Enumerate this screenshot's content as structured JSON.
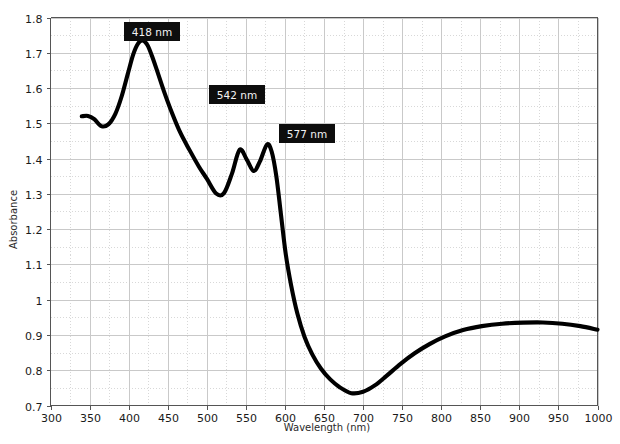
{
  "chart_data": {
    "type": "line",
    "title": "",
    "xlabel": "Wavelength (nm)",
    "ylabel": "Absorbance",
    "xlim": [
      300,
      1000
    ],
    "ylim": [
      0.7,
      1.8
    ],
    "grid": true,
    "legend": "none",
    "x_major_step": 50,
    "x_minor_step": 25,
    "y_major_step": 0.1,
    "y_minor_step": 0.05,
    "x_ticks": [
      "300",
      "350",
      "400",
      "450",
      "500",
      "550",
      "600",
      "650",
      "700",
      "750",
      "800",
      "850",
      "900",
      "950",
      "1000"
    ],
    "y_ticks": [
      "0.7",
      "0.8",
      "0.9",
      "1",
      "1.1",
      "1.2",
      "1.3",
      "1.4",
      "1.5",
      "1.6",
      "1.7",
      "1.8"
    ],
    "series": [
      {
        "name": "absorbance",
        "color": "#000000",
        "x": [
          340,
          348,
          356,
          365,
          374,
          383,
          391,
          399,
          406,
          412,
          418,
          424,
          430,
          437,
          445,
          455,
          466,
          478,
          490,
          500,
          512,
          522,
          532,
          542,
          551,
          560,
          568,
          577,
          583,
          589,
          595,
          601,
          608,
          616,
          625,
          635,
          646,
          658,
          670,
          685,
          700,
          715,
          730,
          748,
          766,
          785,
          805,
          828,
          852,
          878,
          905,
          930,
          955,
          978,
          1000
        ],
        "y": [
          1.52,
          1.521,
          1.512,
          1.492,
          1.497,
          1.527,
          1.576,
          1.641,
          1.696,
          1.726,
          1.735,
          1.722,
          1.69,
          1.645,
          1.592,
          1.532,
          1.474,
          1.424,
          1.377,
          1.343,
          1.301,
          1.302,
          1.356,
          1.425,
          1.398,
          1.365,
          1.392,
          1.44,
          1.42,
          1.35,
          1.24,
          1.13,
          1.04,
          0.96,
          0.895,
          0.845,
          0.805,
          0.774,
          0.752,
          0.735,
          0.739,
          0.757,
          0.784,
          0.818,
          0.848,
          0.874,
          0.896,
          0.914,
          0.925,
          0.932,
          0.935,
          0.9355,
          0.932,
          0.925,
          0.915
        ]
      }
    ],
    "annotations": [
      {
        "label": "418 nm",
        "x": 418,
        "y": 1.795,
        "box_left": 124,
        "box_top": 22,
        "box_width": 56,
        "box_height": 19
      },
      {
        "label": "542 nm",
        "x": 542,
        "y": 1.59,
        "box_left": 209,
        "box_top": 85,
        "box_width": 56,
        "box_height": 19
      },
      {
        "label": "577 nm",
        "x": 577,
        "y": 1.495,
        "box_left": 279,
        "box_top": 124,
        "box_width": 56,
        "box_height": 19
      }
    ]
  },
  "colors": {
    "curve": "#000000",
    "annotation_background": "#0d0d0d",
    "annotation_text": "#f2f2f2",
    "grid_major": "#c9c9c9",
    "grid_minor": "#d8d8d8",
    "axis": "#555555",
    "page_background": "#ffffff"
  }
}
